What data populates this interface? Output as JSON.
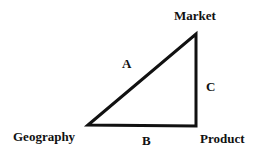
{
  "diagram": {
    "vertices": {
      "market": "Market",
      "geography": "Geography",
      "product": "Product"
    },
    "edges": {
      "a": "A",
      "b": "B",
      "c": "C"
    },
    "stroke_color": "#111111"
  }
}
